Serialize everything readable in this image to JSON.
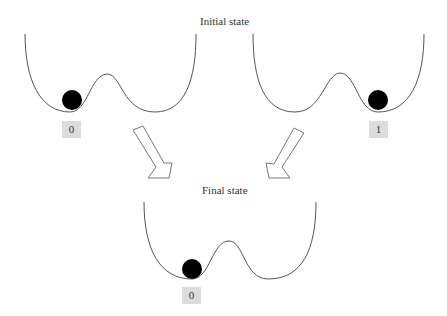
{
  "diagram": {
    "initial_title": "Initial state",
    "final_title": "Final state",
    "wells": [
      {
        "id": "initial-left",
        "state_label": "0",
        "ball_position": "left-well"
      },
      {
        "id": "initial-right",
        "state_label": "1",
        "ball_position": "right-well"
      },
      {
        "id": "final",
        "state_label": "0",
        "ball_position": "left-well"
      }
    ],
    "colors": {
      "curve": "#555555",
      "ball": "#000000",
      "label_bg": "#dcdcdc",
      "arrow_stroke": "#777777"
    }
  }
}
